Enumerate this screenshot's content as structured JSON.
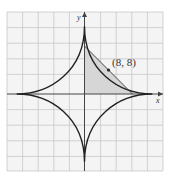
{
  "diagram": {
    "type": "astroid with tangent line",
    "axes": {
      "x_label": "x",
      "y_label": "y"
    },
    "point_label": "(8, 8)",
    "colors": {
      "grid": "#c8c8c8",
      "grid_bg": "#f4f4f4",
      "curve": "#222222",
      "shade": "#d6d6d6",
      "axis": "#444444"
    }
  }
}
